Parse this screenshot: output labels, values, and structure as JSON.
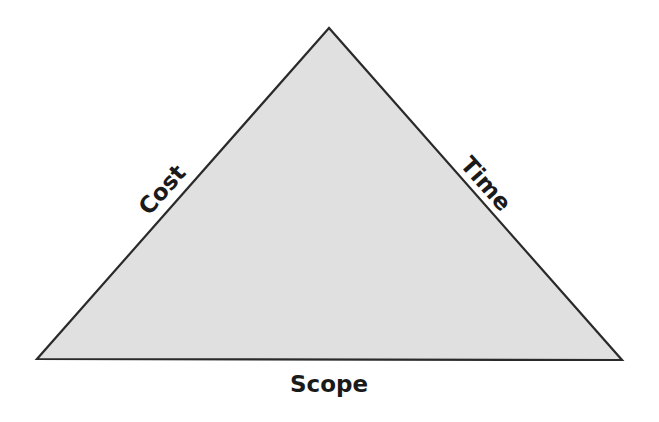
{
  "diagram": {
    "type": "triangle",
    "colors": {
      "fill": "#e0e0e0",
      "stroke": "#2a2a2a",
      "text": "#1a1a1a",
      "background": "#ffffff"
    },
    "vertices": {
      "apex": [
        329,
        28
      ],
      "bottom_left": [
        37,
        359
      ],
      "bottom_right": [
        622,
        360
      ]
    },
    "labels": {
      "left_edge": "Cost",
      "right_edge": "Time",
      "bottom_edge": "Scope"
    }
  }
}
